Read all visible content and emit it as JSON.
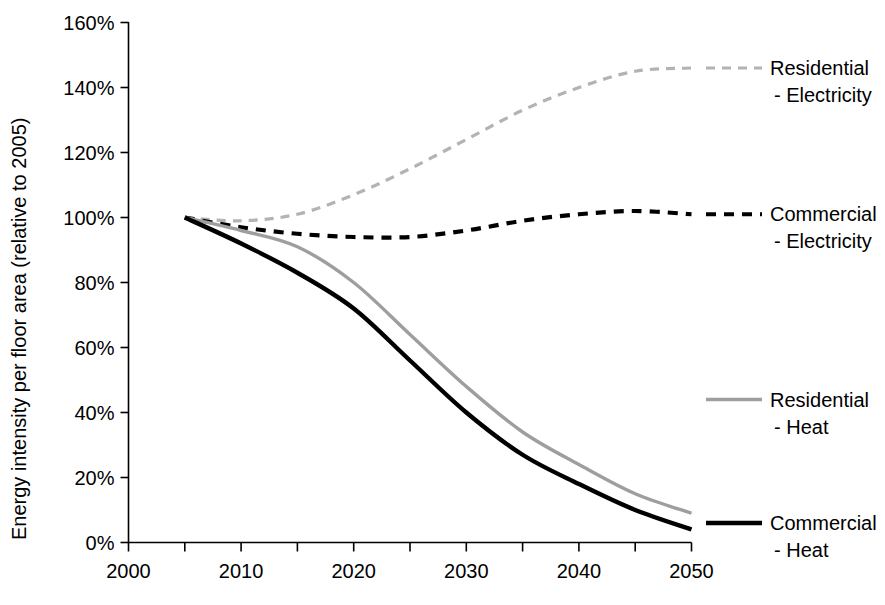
{
  "chart_data": {
    "type": "line",
    "title": "",
    "xlabel": "",
    "ylabel": "Energy intensity per floor area (relative to 2005)",
    "xlim": [
      2000,
      2050
    ],
    "ylim": [
      0,
      160
    ],
    "grid": false,
    "legend_position": "right",
    "x_ticks": [
      2000,
      2005,
      2010,
      2015,
      2020,
      2025,
      2030,
      2035,
      2040,
      2045,
      2050
    ],
    "x_tick_labels": [
      "2000",
      "",
      "2010",
      "",
      "2020",
      "",
      "2030",
      "",
      "2040",
      "",
      "2050"
    ],
    "y_ticks": [
      0,
      20,
      40,
      60,
      80,
      100,
      120,
      140,
      160
    ],
    "y_tick_labels": [
      "0%",
      "20%",
      "40%",
      "60%",
      "80%",
      "100%",
      "120%",
      "140%",
      "160%"
    ],
    "x": [
      2005,
      2010,
      2015,
      2020,
      2025,
      2030,
      2035,
      2040,
      2045,
      2050
    ],
    "series": [
      {
        "name": "Residential - Electricity",
        "label_line1": "Residential",
        "label_line2": "- Electricity",
        "color": "#b3b3b3",
        "style": "dashed",
        "width": 3.2,
        "dasharray": "9,7",
        "values": [
          100,
          99,
          101,
          107,
          115,
          124,
          133,
          140,
          145,
          146
        ],
        "label_x": 2051,
        "label_y": 146
      },
      {
        "name": "Commercial - Electricity",
        "label_line1": "Commercial",
        "label_line2": "- Electricity",
        "color": "#000000",
        "style": "dashed",
        "width": 4.2,
        "dasharray": "10,8",
        "values": [
          100,
          97,
          95,
          94,
          94,
          96,
          99,
          101,
          102,
          101
        ],
        "label_x": 2051,
        "label_y": 101
      },
      {
        "name": "Residential - Heat",
        "label_line1": "Residential",
        "label_line2": "- Heat",
        "color": "#9e9e9e",
        "style": "solid",
        "width": 3.4,
        "dasharray": "",
        "values": [
          100,
          96,
          91,
          80,
          64,
          48,
          34,
          24,
          15,
          9
        ],
        "label_x": 2051,
        "label_y": 44
      },
      {
        "name": "Commercial - Heat",
        "label_line1": "Commercial",
        "label_line2": "- Heat",
        "color": "#000000",
        "style": "solid",
        "width": 4.4,
        "dasharray": "",
        "values": [
          100,
          92,
          83,
          72,
          56,
          40,
          27,
          18,
          10,
          4
        ],
        "label_x": 2051,
        "label_y": 6
      }
    ]
  }
}
